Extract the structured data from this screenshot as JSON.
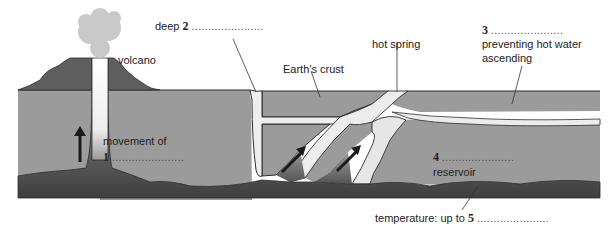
{
  "diagram": {
    "type": "geothermal cross-section",
    "colors": {
      "crust": "#9b9b9b",
      "crust_outline": "#2e2e2e",
      "volcano": "#5e5e5e",
      "smoke": "#c9c9c9",
      "channel": "#ececec",
      "magma_dark": "#4a4a4a",
      "arrow": "#1a1a1a"
    },
    "labels": {
      "volcano": "volcano",
      "deep_prefix": "deep",
      "deep_num": "2",
      "earths_crust": "Earth’s crust",
      "hot_spring": "hot spring",
      "q3_num": "3",
      "q3_line1": "preventing hot water",
      "q3_line2": "ascending",
      "movement_of": "movement of",
      "q1_num": "1",
      "q4_num": "4",
      "reservoir": "reservoir",
      "temperature_prefix": "temperature: up to",
      "q5_num": "5",
      "blank": "......................"
    }
  }
}
